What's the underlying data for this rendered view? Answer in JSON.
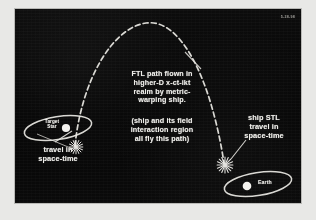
{
  "slide": {
    "background_color": "#090909",
    "ink_color": "#efeeea",
    "corner_stamp": "5-28-98"
  },
  "annotations": {
    "ftl_path": "FTL path flown in\nhigher-D x-ct-ikt\nrealm by metric-\nwarping ship.",
    "ship_field": "(ship and its field\ninteraction region\nall fly this path)",
    "ship_stl": "ship STL\ntravel in\nspace-time",
    "travel_spacetime": "travel in\nspace-time"
  },
  "bodies": {
    "target_star": {
      "label": "Target\nStar"
    },
    "earth": {
      "label": "Earth"
    }
  },
  "diagram": {
    "curve_style": "dashed",
    "curve_description": "parabolic FTL trajectory arc",
    "endpoint_markers": [
      "starburst-left",
      "starburst-right"
    ],
    "orbit_markers": [
      "ellipse-target-star",
      "ellipse-earth"
    ],
    "leader_lines": 3
  }
}
